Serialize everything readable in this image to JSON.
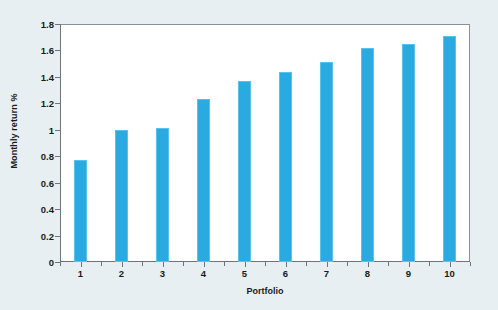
{
  "chart_data": {
    "type": "bar",
    "title": "",
    "xlabel": "Portfolio",
    "ylabel": "Monthly return %",
    "categories": [
      "1",
      "2",
      "3",
      "4",
      "5",
      "6",
      "7",
      "8",
      "9",
      "10"
    ],
    "values": [
      0.77,
      1.0,
      1.01,
      1.23,
      1.37,
      1.44,
      1.51,
      1.62,
      1.65,
      1.71
    ],
    "ylim": [
      0,
      1.8
    ],
    "xlim_categories": 10,
    "ytick_labels": [
      "0",
      "0.2",
      "0.4",
      "0.6",
      "0.8",
      "1",
      "1.2",
      "1.4",
      "1.6",
      "1.8"
    ],
    "ytick_values": [
      0,
      0.2,
      0.4,
      0.6,
      0.8,
      1.0,
      1.2,
      1.4,
      1.6,
      1.8
    ],
    "grid": false,
    "legend": null,
    "bar_color": "#29abe2",
    "bar_edge_color": "#59c2ea",
    "plot_background": "#ffffff",
    "figure_background": "#e7eff3",
    "axis_color": "#6e7478",
    "frame_color": "#8b9094",
    "text_color": "#1a1a1a"
  }
}
